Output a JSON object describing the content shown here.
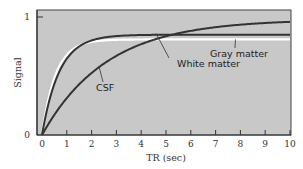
{
  "chart_data": {
    "type": "line",
    "title": "",
    "xlabel": "TR (sec)",
    "ylabel": "Signal",
    "xlim": [
      0,
      10
    ],
    "ylim": [
      0,
      1
    ],
    "x_ticks": [
      "0",
      "1",
      "2",
      "3",
      "4",
      "5",
      "6",
      "7",
      "8",
      "9",
      "10"
    ],
    "y_ticks": [
      "0",
      "1"
    ],
    "grid": false,
    "background_color": "#c8c8c8",
    "series": [
      {
        "name": "White matter",
        "color": "#333333",
        "plateau": 0.85,
        "t1": 0.7,
        "x": [
          0,
          0.5,
          1,
          1.5,
          2,
          3,
          4,
          5,
          6,
          7,
          8,
          9,
          10
        ],
        "y": [
          0,
          0.43,
          0.65,
          0.76,
          0.81,
          0.84,
          0.85,
          0.85,
          0.85,
          0.85,
          0.85,
          0.85,
          0.85
        ]
      },
      {
        "name": "Gray matter",
        "color": "#ffffff",
        "plateau": 0.81,
        "t1": 0.55,
        "x": [
          0,
          0.5,
          1,
          1.5,
          2,
          3,
          4,
          5,
          6,
          7,
          8,
          9,
          10
        ],
        "y": [
          0,
          0.49,
          0.68,
          0.76,
          0.79,
          0.81,
          0.81,
          0.81,
          0.81,
          0.81,
          0.81,
          0.81,
          0.81
        ]
      },
      {
        "name": "CSF",
        "color": "#333333",
        "plateau": 0.98,
        "t1": 2.6,
        "x": [
          0,
          0.5,
          1,
          1.5,
          2,
          3,
          4,
          5,
          6,
          7,
          8,
          9,
          10
        ],
        "y": [
          0,
          0.17,
          0.32,
          0.43,
          0.53,
          0.67,
          0.77,
          0.85,
          0.89,
          0.92,
          0.95,
          0.96,
          0.97
        ]
      }
    ],
    "annotations": [
      {
        "text": "White matter",
        "target": "White matter",
        "x": 4.6,
        "y": 0.86
      },
      {
        "text": "Gray matter",
        "target": "Gray matter",
        "x": 7.8,
        "y": 0.81
      },
      {
        "text": "CSF",
        "target": "CSF",
        "x": 2.3,
        "y": 0.58
      }
    ]
  }
}
